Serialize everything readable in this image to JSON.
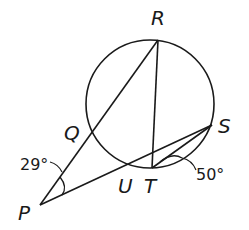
{
  "diagram": {
    "circle": {
      "cx": 150,
      "cy": 104,
      "r": 64
    },
    "points": {
      "R": {
        "label": "R",
        "x": 158,
        "y": 40
      },
      "S": {
        "label": "S",
        "x": 212,
        "y": 125
      },
      "T": {
        "label": "T",
        "x": 152,
        "y": 168
      },
      "U": {
        "label": "U",
        "x": 126,
        "y": 164
      },
      "Q": {
        "label": "Q",
        "x": 92,
        "y": 132
      },
      "P": {
        "label": "P",
        "x": 40,
        "y": 205
      }
    },
    "segments": [
      {
        "from": "P",
        "to": "R"
      },
      {
        "from": "P",
        "to": "S"
      },
      {
        "from": "R",
        "to": "T"
      },
      {
        "from": "T",
        "to": "S"
      }
    ],
    "angles": {
      "angle_P": {
        "label": "29°"
      },
      "angle_T": {
        "label": "50°"
      }
    },
    "colors": {
      "stroke": "#1a1a1a",
      "background": "#ffffff"
    }
  }
}
